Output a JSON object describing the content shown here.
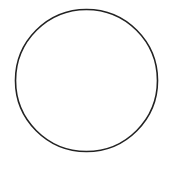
{
  "diagram": {
    "shape": "circle",
    "center": {
      "x": 86.5,
      "y": 80.5
    },
    "radius": 71,
    "stroke_color": "#222222",
    "stroke_width": 1.6,
    "fill_color": "none",
    "background_color": "#ffffff"
  }
}
